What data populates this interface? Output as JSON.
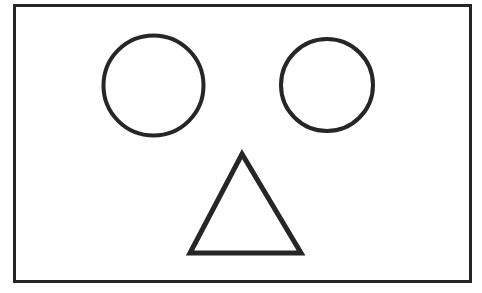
{
  "figure": {
    "canvas": {
      "width": 482,
      "height": 293,
      "background_color": "#ffffff"
    },
    "stroke_color": "#262626",
    "fill_color": "none",
    "shapes": [
      {
        "id": "frame",
        "name": "rectangle-frame",
        "type": "rectangle",
        "label": "Rectangle frame",
        "x": 14.5,
        "y": 5.5,
        "width": 456,
        "height": 276,
        "stroke_width": 3
      },
      {
        "id": "eye-left",
        "name": "circle-left",
        "type": "circle",
        "label": "Left circle",
        "cx": 153.5,
        "cy": 85.5,
        "r": 50,
        "stroke_width": 4
      },
      {
        "id": "eye-right",
        "name": "circle-right",
        "type": "circle",
        "label": "Right circle",
        "cx": 327,
        "cy": 85,
        "r": 46,
        "stroke_width": 4
      },
      {
        "id": "nose",
        "name": "triangle",
        "type": "triangle",
        "label": "Triangle",
        "points": "242,154 301,253 190,253",
        "apex_x": 242,
        "apex_y": 154,
        "base_left_x": 190,
        "base_right_x": 301,
        "base_y": 253,
        "stroke_width": 5
      }
    ]
  }
}
